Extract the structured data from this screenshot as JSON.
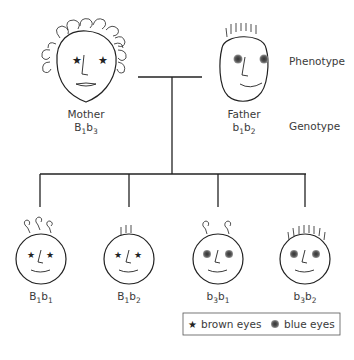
{
  "parents": {
    "mother": {
      "label": "Mother",
      "genotype": {
        "a": "B",
        "a_sub": "1",
        "b": "b",
        "b_sub": "3"
      },
      "eyes": "brown",
      "hair": "curly"
    },
    "father": {
      "label": "Father",
      "genotype": {
        "a": "b",
        "a_sub": "1",
        "b": "b",
        "b_sub": "2"
      },
      "eyes": "blue",
      "hair": "straight"
    }
  },
  "row_labels": {
    "phenotype": "Phenotype",
    "genotype": "Genotype"
  },
  "children": [
    {
      "genotype": {
        "a": "B",
        "a_sub": "1",
        "b": "b",
        "b_sub": "1"
      },
      "eyes": "brown",
      "hair": "curly"
    },
    {
      "genotype": {
        "a": "B",
        "a_sub": "1",
        "b": "b",
        "b_sub": "2"
      },
      "eyes": "brown",
      "hair": "straight"
    },
    {
      "genotype": {
        "a": "b",
        "a_sub": "3",
        "b": "b",
        "b_sub": "1"
      },
      "eyes": "blue",
      "hair": "curly"
    },
    {
      "genotype": {
        "a": "b",
        "a_sub": "3",
        "b": "b",
        "b_sub": "2"
      },
      "eyes": "blue",
      "hair": "straight"
    }
  ],
  "legend": {
    "brown": "brown eyes",
    "blue": "blue eyes"
  },
  "colors": {
    "line": "#222222",
    "text": "#3a3a3a",
    "blue_eye": "#555555"
  }
}
